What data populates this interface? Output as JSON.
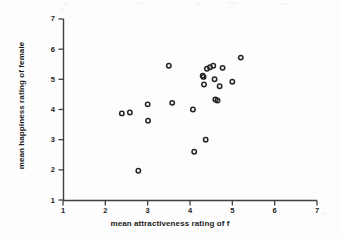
{
  "chart_data": {
    "type": "scatter",
    "title": "",
    "xlabel": "mean attractiveness rating of f",
    "ylabel": "mean happiness rating of female",
    "xlim": [
      1,
      7
    ],
    "ylim": [
      1,
      7
    ],
    "xticks": [
      1,
      2,
      3,
      4,
      5,
      6,
      7
    ],
    "yticks": [
      1,
      2,
      3,
      4,
      5,
      6,
      7
    ],
    "xtick_labels": [
      "1",
      "2",
      "3",
      "4",
      "5",
      "6",
      "7"
    ],
    "ytick_labels": [
      "1",
      "2",
      "3",
      "4",
      "5",
      "6",
      "7"
    ],
    "grid": false,
    "legend": null,
    "marker": "open-circle",
    "marker_color": "#222222",
    "n_points": 23,
    "x": [
      2.39,
      2.58,
      2.78,
      3.0,
      3.01,
      3.5,
      3.58,
      4.07,
      4.1,
      4.3,
      4.32,
      4.33,
      4.37,
      4.4,
      4.47,
      4.55,
      4.58,
      4.6,
      4.65,
      4.7,
      4.77,
      5.0,
      5.2
    ],
    "y": [
      3.87,
      3.9,
      1.97,
      4.17,
      3.63,
      5.45,
      4.22,
      4.0,
      2.6,
      5.12,
      5.08,
      4.83,
      3.0,
      5.35,
      5.4,
      5.45,
      5.0,
      4.33,
      4.3,
      4.77,
      5.38,
      4.92,
      5.72
    ],
    "points": [
      {
        "x": 2.39,
        "y": 3.87
      },
      {
        "x": 2.58,
        "y": 3.9
      },
      {
        "x": 2.78,
        "y": 1.97
      },
      {
        "x": 3.0,
        "y": 4.17
      },
      {
        "x": 3.01,
        "y": 3.63
      },
      {
        "x": 3.5,
        "y": 5.45
      },
      {
        "x": 3.58,
        "y": 4.22
      },
      {
        "x": 4.07,
        "y": 4.0
      },
      {
        "x": 4.1,
        "y": 2.6
      },
      {
        "x": 4.3,
        "y": 5.12
      },
      {
        "x": 4.32,
        "y": 5.08
      },
      {
        "x": 4.33,
        "y": 4.83
      },
      {
        "x": 4.37,
        "y": 3.0
      },
      {
        "x": 4.4,
        "y": 5.35
      },
      {
        "x": 4.47,
        "y": 5.4
      },
      {
        "x": 4.55,
        "y": 5.45
      },
      {
        "x": 4.58,
        "y": 5.0
      },
      {
        "x": 4.6,
        "y": 4.33
      },
      {
        "x": 4.65,
        "y": 4.3
      },
      {
        "x": 4.7,
        "y": 4.77
      },
      {
        "x": 4.77,
        "y": 5.38
      },
      {
        "x": 5.0,
        "y": 4.92
      },
      {
        "x": 5.2,
        "y": 5.72
      }
    ]
  },
  "axes": {
    "x_axis_name": "x-axis",
    "y_axis_name": "y-axis"
  }
}
